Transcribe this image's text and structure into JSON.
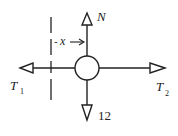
{
  "diagram": {
    "type": "free-body-diagram",
    "forces": {
      "normal": {
        "label": "N",
        "direction": "up"
      },
      "tension_left": {
        "label": "T",
        "subscript": "1",
        "direction": "left"
      },
      "tension_right": {
        "label": "T",
        "subscript": "2",
        "direction": "right"
      },
      "weight": {
        "label": "12",
        "direction": "down"
      }
    },
    "distance": {
      "label": "x",
      "prefix": "-",
      "arrow": "→"
    },
    "colors": {
      "stroke": "#222222",
      "background": "#ffffff"
    }
  }
}
